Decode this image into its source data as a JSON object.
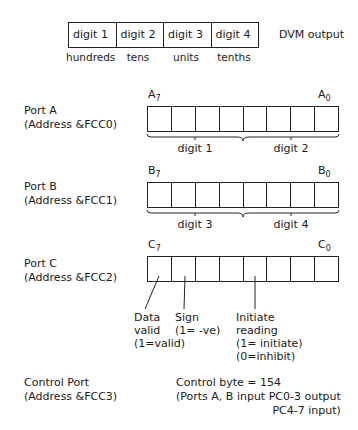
{
  "dvm": {
    "cells": [
      "digit 1",
      "digit 2",
      "digit 3",
      "digit 4"
    ],
    "places": [
      "hundreds",
      "tens",
      "units",
      "tenths"
    ],
    "label": "DVM output"
  },
  "ports": [
    {
      "name": "Port A",
      "address": "(Address &FCC0)",
      "msb_letter": "A",
      "msb_index": "7",
      "lsb_letter": "A",
      "lsb_index": "0",
      "groups": [
        "digit 1",
        "digit 2"
      ]
    },
    {
      "name": "Port B",
      "address": "(Address &FCC1)",
      "msb_letter": "B",
      "msb_index": "7",
      "lsb_letter": "B",
      "lsb_index": "0",
      "groups": [
        "digit 3",
        "digit 4"
      ]
    },
    {
      "name": "Port C",
      "address": "(Address &FCC2)",
      "msb_letter": "C",
      "msb_index": "7",
      "lsb_letter": "C",
      "lsb_index": "0",
      "annotations": [
        {
          "lines": [
            "Data",
            "valid",
            "(1=valid)"
          ]
        },
        {
          "lines": [
            "Sign",
            "(1= -ve)"
          ]
        },
        {
          "lines": [
            "Initiate",
            "reading",
            "(1= initiate)",
            "(0=inhibit)"
          ]
        }
      ]
    }
  ],
  "control": {
    "name": "Control Port",
    "address": "(Address &FCC3)",
    "line1": "Control byte = 154",
    "line2": "(Ports A, B input  PC0-3 output",
    "line3": "PC4-7 input)"
  }
}
